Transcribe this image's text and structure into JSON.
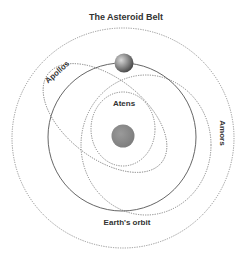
{
  "title": "The Asteroid Belt",
  "labels": {
    "apollos": "Apollos",
    "atens": "Atens",
    "amors": "Amors",
    "earth_orbit": "Earth's orbit"
  },
  "bodies": {
    "sun": "sun",
    "earth": "earth"
  },
  "colors": {
    "line": "#555555",
    "dotted": "#777777",
    "sun": "#8a8a8a",
    "earth": "#6e6e6e",
    "text": "#333333"
  }
}
